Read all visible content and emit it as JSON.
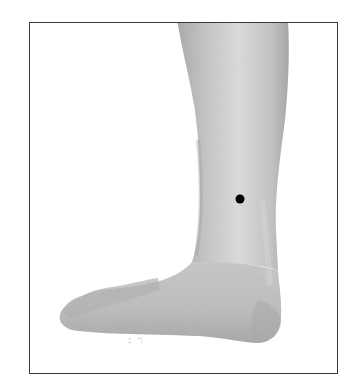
{
  "figure": {
    "frame": {
      "left": 29,
      "top": 22,
      "right": 338,
      "bottom": 374,
      "border_color": "#3a3a3a"
    },
    "skin_colors": {
      "light": "#d6d6d6",
      "mid": "#b8b8b8",
      "dark": "#9a9a9a"
    },
    "marker": {
      "x": 240,
      "y": 199,
      "diameter": 9,
      "color": "#000000",
      "label": ""
    },
    "faint_marks": [
      {
        "text": "ℷ ℸ",
        "x": 128,
        "y": 342
      }
    ]
  }
}
